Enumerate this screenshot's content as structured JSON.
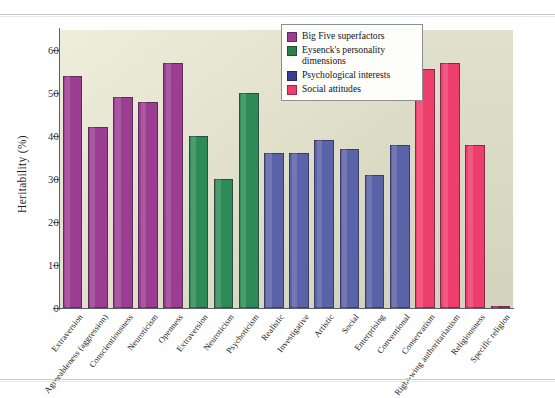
{
  "figure": {
    "background": "#e9e8cf",
    "axis_color": "#5a5f6b"
  },
  "legend": {
    "items": [
      {
        "label": "Big Five superfactors",
        "color": "#9B3E91"
      },
      {
        "label": "Eysenck's personality dimensions",
        "color": "#2E7D4F"
      },
      {
        "label": "Psychological interests",
        "color": "#3A3F94"
      },
      {
        "label": "Social attitudes",
        "color": "#EE3E6E"
      }
    ]
  },
  "chart_data": {
    "type": "bar",
    "title": "",
    "xlabel": "",
    "ylabel": "Heritability (%)",
    "ylim": [
      0,
      60
    ],
    "yticks": [
      0,
      10,
      20,
      30,
      40,
      50,
      60
    ],
    "grid": false,
    "legend_position": "top-right",
    "categories": [
      "Extraversion",
      "Agreeableness (aggression)",
      "Conscientiousness",
      "Neuroticism",
      "Openness",
      "Extraversion",
      "Neuroticism",
      "Psychoticism",
      "Realistic",
      "Investigative",
      "Artistic",
      "Social",
      "Enterprising",
      "Conventional",
      "Conservatism",
      "Right-wing authoritarianism",
      "Religiousness",
      "Specific religion"
    ],
    "values": [
      54,
      42,
      49,
      48,
      57,
      40,
      30,
      50,
      36,
      36,
      39,
      37,
      31,
      38,
      55.5,
      57,
      38,
      0.4
    ],
    "groups": [
      "Big Five superfactors",
      "Big Five superfactors",
      "Big Five superfactors",
      "Big Five superfactors",
      "Big Five superfactors",
      "Eysenck's personality dimensions",
      "Eysenck's personality dimensions",
      "Eysenck's personality dimensions",
      "Psychological interests",
      "Psychological interests",
      "Psychological interests",
      "Psychological interests",
      "Psychological interests",
      "Psychological interests",
      "Social attitudes",
      "Social attitudes",
      "Social attitudes",
      "Social attitudes"
    ],
    "colors": [
      "#9B3E91",
      "#9B3E91",
      "#9B3E91",
      "#9B3E91",
      "#9B3E91",
      "#2E8B57",
      "#2E8B57",
      "#2E8B57",
      "#5A62A8",
      "#5A62A8",
      "#5A62A8",
      "#5A62A8",
      "#5A62A8",
      "#5A62A8",
      "#EE3E6E",
      "#EE3E6E",
      "#EE3E6E",
      "#EE3E6E"
    ]
  }
}
